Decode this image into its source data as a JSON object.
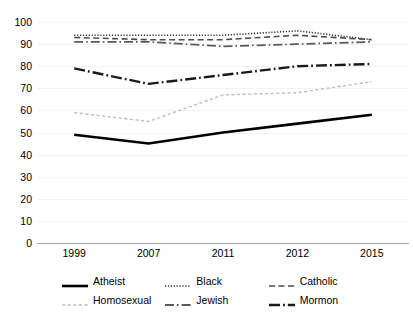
{
  "chart_data": {
    "type": "line",
    "title": "",
    "subtitle": "",
    "xlabel": "",
    "ylabel": "",
    "categories": [
      "1999",
      "2007",
      "2011",
      "2012",
      "2015"
    ],
    "x": [
      "1999",
      "2007",
      "2011",
      "2012",
      "2015"
    ],
    "ylim": [
      0,
      100
    ],
    "yticks": [
      0,
      10,
      20,
      30,
      40,
      50,
      60,
      70,
      80,
      90,
      100
    ],
    "grid": true,
    "legend_position": "bottom",
    "series": [
      {
        "name": "Atheist",
        "values": [
          49,
          45,
          50,
          54,
          58
        ],
        "line_style": "solid",
        "color": "#000000",
        "width": 2.6
      },
      {
        "name": "Black",
        "values": [
          94,
          94,
          94,
          96,
          92
        ],
        "line_style": "dotted",
        "color": "#333333",
        "width": 1.6
      },
      {
        "name": "Catholic",
        "values": [
          93,
          92,
          92,
          94,
          92
        ],
        "line_style": "dashed",
        "color": "#4d4d4d",
        "width": 1.6
      },
      {
        "name": "Homosexual",
        "values": [
          59,
          55,
          67,
          68,
          73
        ],
        "line_style": "dashed-fine",
        "color": "#bfbfbf",
        "width": 1.4
      },
      {
        "name": "Jewish",
        "values": [
          91,
          91,
          89,
          90,
          91
        ],
        "line_style": "dash-dot",
        "color": "#595959",
        "width": 1.8
      },
      {
        "name": "Mormon",
        "values": [
          79,
          72,
          76,
          80,
          81
        ],
        "line_style": "dash-dot-heavy",
        "color": "#1a1a1a",
        "width": 2.4
      }
    ]
  },
  "legend": {
    "items": [
      {
        "label": "Atheist"
      },
      {
        "label": "Black"
      },
      {
        "label": "Catholic"
      },
      {
        "label": "Homosexual"
      },
      {
        "label": "Jewish"
      },
      {
        "label": "Mormon"
      }
    ]
  },
  "axes": {
    "y_tick_labels": [
      "100",
      "90",
      "80",
      "70",
      "60",
      "50",
      "40",
      "30",
      "20",
      "10",
      "0"
    ],
    "x_tick_labels": [
      "1999",
      "2007",
      "2011",
      "2012",
      "2015"
    ]
  },
  "colors": {
    "gridline": "#f2f2f2",
    "axis": "#a6a6a6",
    "text": "#000000",
    "background": "#ffffff"
  }
}
